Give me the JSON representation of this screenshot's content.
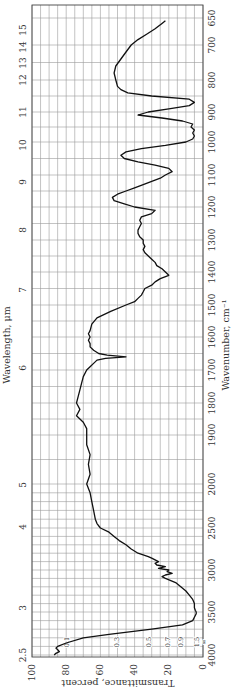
{
  "chart_data": {
    "type": "line",
    "title": "",
    "orientation": "rotated 90 degrees (transmittance on horizontal axis, wavenumber on vertical axis)",
    "xlabel": "Transmittance, percent",
    "ylabel_right": "Wavenumber, cm⁻¹",
    "ylabel_left": "Wavelength, μm",
    "xlim": [
      100,
      0
    ],
    "transmittance_ticks": [
      "100",
      "80",
      "60",
      "40",
      "20",
      "0"
    ],
    "transmittance_tick_values": [
      100,
      80,
      60,
      40,
      20,
      0
    ],
    "wavenumber_ticks": [
      "650",
      "700",
      "800",
      "900",
      "1000",
      "1100",
      "1200",
      "1300",
      "1400",
      "1500",
      "1600",
      "1700",
      "1800",
      "1900",
      "2000",
      "2500",
      "3000",
      "3500",
      "4000"
    ],
    "wavenumber_tick_values": [
      650,
      700,
      800,
      900,
      1000,
      1100,
      1200,
      1300,
      1400,
      1500,
      1600,
      1700,
      1800,
      1900,
      2000,
      2500,
      3000,
      3500,
      4000
    ],
    "wavenumber_tick_pixels": [
      18,
      45,
      80,
      112,
      142,
      175,
      207,
      240,
      272,
      305,
      337,
      370,
      403,
      435,
      484,
      528,
      570,
      612,
      655
    ],
    "wavelength_ticks": [
      "2.5",
      "3",
      "4",
      "5",
      "6",
      "7",
      "8",
      "9",
      "10",
      "11",
      "12",
      "13",
      "14",
      "15"
    ],
    "wavelength_tick_pixels": [
      655,
      608,
      527,
      485,
      368,
      290,
      230,
      182,
      145,
      112,
      80,
      63,
      47,
      30
    ],
    "absorbance_labels": [
      "0.1",
      "0.3",
      "0.5",
      "0.7",
      "0.9",
      "1.5",
      "∞"
    ],
    "absorbance_label_transmittance": [
      79.4,
      50.1,
      31.6,
      20.0,
      12.6,
      3.2,
      0
    ],
    "grid": true,
    "legend": null,
    "series": [
      {
        "name": "IR spectrum",
        "x_wavenumber": [
          4000,
          3980,
          3960,
          3940,
          3920,
          3900,
          3860,
          3800,
          3760,
          3700,
          3650,
          3600,
          3560,
          3520,
          3500,
          3480,
          3450,
          3400,
          3350,
          3300,
          3250,
          3200,
          3150,
          3100,
          3080,
          3060,
          3040,
          3020,
          3000,
          2980,
          2960,
          2940,
          2920,
          2900,
          2880,
          2860,
          2840,
          2800,
          2750,
          2700,
          2650,
          2600,
          2550,
          2500,
          2450,
          2400,
          2300,
          2200,
          2100,
          2000,
          1980,
          1960,
          1940,
          1920,
          1900,
          1880,
          1860,
          1840,
          1820,
          1800,
          1780,
          1760,
          1740,
          1720,
          1700,
          1690,
          1680,
          1670,
          1665,
          1660,
          1655,
          1650,
          1640,
          1630,
          1620,
          1610,
          1600,
          1590,
          1580,
          1560,
          1540,
          1520,
          1500,
          1490,
          1480,
          1470,
          1460,
          1450,
          1440,
          1430,
          1420,
          1410,
          1400,
          1390,
          1380,
          1370,
          1360,
          1350,
          1340,
          1330,
          1320,
          1310,
          1300,
          1290,
          1280,
          1270,
          1260,
          1250,
          1240,
          1230,
          1220,
          1210,
          1200,
          1190,
          1180,
          1170,
          1160,
          1150,
          1140,
          1130,
          1120,
          1110,
          1100,
          1090,
          1080,
          1070,
          1060,
          1050,
          1040,
          1030,
          1020,
          1010,
          1000,
          990,
          980,
          970,
          960,
          950,
          940,
          930,
          920,
          910,
          900,
          890,
          880,
          870,
          860,
          850,
          840,
          830,
          820,
          800,
          780,
          760,
          740,
          720,
          700,
          690,
          680,
          670,
          660,
          655
        ],
        "y_transmittance": [
          87,
          86,
          84,
          85,
          86,
          85,
          80,
          70,
          55,
          30,
          12,
          6,
          5,
          4,
          4,
          4.5,
          5,
          5,
          6,
          8,
          10,
          13,
          16,
          22,
          24,
          22,
          18,
          21,
          20,
          26,
          22,
          27,
          28,
          26,
          28,
          30,
          32,
          38,
          42,
          45,
          49,
          52,
          55,
          60,
          62,
          63,
          64,
          65,
          66,
          68,
          66,
          67,
          66,
          68,
          68,
          68,
          70,
          74,
          72,
          74,
          73,
          72,
          71,
          70,
          68,
          66,
          64,
          62,
          57,
          45,
          56,
          61,
          64,
          66,
          66,
          67,
          66,
          67,
          66,
          65,
          62,
          54,
          45,
          40,
          38,
          36,
          35,
          34,
          30,
          28,
          25,
          20,
          22,
          24,
          27,
          28,
          30,
          32,
          34,
          35,
          34,
          35,
          35,
          37,
          38,
          38,
          37,
          36,
          37,
          36,
          30,
          28,
          40,
          46,
          52,
          53,
          50,
          45,
          40,
          35,
          30,
          25,
          22,
          18,
          20,
          28,
          38,
          46,
          48,
          45,
          36,
          22,
          10,
          6,
          5,
          6,
          5,
          7,
          6,
          12,
          24,
          38,
          32,
          20,
          8,
          5,
          8,
          30,
          44,
          48,
          50,
          51,
          52,
          51,
          48,
          45,
          42,
          38,
          33,
          28,
          24,
          22,
          21,
          20,
          20
        ]
      }
    ]
  }
}
